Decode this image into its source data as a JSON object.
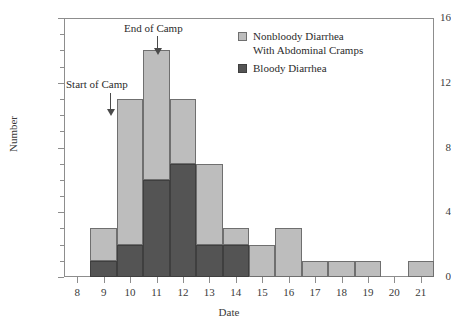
{
  "chart_data": {
    "type": "bar",
    "title": "",
    "xlabel": "Date",
    "ylabel": "Number",
    "xlim": [
      7.5,
      21.5
    ],
    "ylim": [
      0,
      16
    ],
    "grid": false,
    "stacked": true,
    "legend_position": "top-right",
    "categories": [
      8,
      9,
      10,
      11,
      12,
      13,
      14,
      15,
      16,
      17,
      18,
      19,
      20,
      21
    ],
    "x_tick_labels": [
      "8",
      "9",
      "10",
      "11",
      "12",
      "13",
      "14",
      "15",
      "16",
      "17",
      "18",
      "19",
      "20",
      "21"
    ],
    "y_tick_labels": [
      "0",
      "4",
      "8",
      "12",
      "16"
    ],
    "y_tick_values": [
      0,
      4,
      8,
      12,
      16
    ],
    "y_minor_tick_interval": 1,
    "series": [
      {
        "name": "Bloody Diarrhea",
        "color": "#545454",
        "values": [
          0,
          1,
          2,
          6,
          7,
          2,
          2,
          0,
          0,
          0,
          0,
          0,
          0,
          0
        ]
      },
      {
        "name": "Nonbloody Diarrhea With Abdominal Cramps",
        "color": "#bdbdbd",
        "values": [
          0,
          2,
          9,
          8,
          4,
          5,
          1,
          2,
          3,
          1,
          1,
          1,
          0,
          1
        ]
      }
    ],
    "totals": [
      0,
      3,
      11,
      14,
      11,
      7,
      3,
      2,
      3,
      1,
      1,
      1,
      0,
      1
    ],
    "annotations": [
      {
        "label": "Start of Camp",
        "x": 9,
        "arrow": "down"
      },
      {
        "label": "End of Camp",
        "x": 11,
        "arrow": "down"
      }
    ]
  },
  "legend": {
    "items": [
      {
        "label": "Nonbloody Diarrhea\nWith Abdominal Cramps",
        "color": "#bdbdbd"
      },
      {
        "label": "Bloody Diarrhea",
        "color": "#545454"
      }
    ]
  },
  "annotations": {
    "start_of_camp": "Start of Camp",
    "end_of_camp": "End of Camp"
  },
  "axes": {
    "y_title": "Number",
    "x_title": "Date"
  },
  "colors": {
    "nonbloody": "#bdbdbd",
    "bloody": "#545454",
    "frame": "#8d8d8d",
    "text": "#2b2b2b"
  }
}
